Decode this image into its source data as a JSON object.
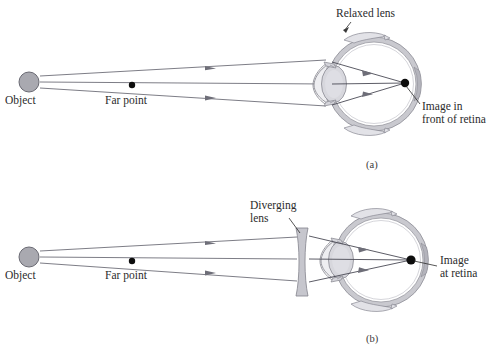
{
  "figure": {
    "background_color": "#ffffff",
    "width": 494,
    "height": 351
  },
  "panels": [
    {
      "tag": "(a)",
      "tag_position": {
        "x": 368,
        "y": 166
      },
      "labels": {
        "object": "Object",
        "far_point": "Far point",
        "lens_state": "Relaxed lens",
        "image_line1": "Image in",
        "image_line2": "front of retina"
      },
      "object_point": {
        "x": 29,
        "y": 82
      },
      "far_point": {
        "x": 132,
        "y": 86
      },
      "image_point": {
        "x": 405,
        "y": 83
      },
      "eye_center": {
        "x": 374,
        "y": 84
      },
      "eye_radius": 48,
      "rays": [
        {
          "name": "upper-ray",
          "from": {
            "x": 40,
            "y": 76
          },
          "to": {
            "x": 325,
            "y": 62
          }
        },
        {
          "name": "axis-ray",
          "from": {
            "x": 40,
            "y": 82
          },
          "to": {
            "x": 325,
            "y": 84
          }
        },
        {
          "name": "lower-ray",
          "from": {
            "x": 40,
            "y": 88
          },
          "to": {
            "x": 325,
            "y": 104
          }
        }
      ]
    },
    {
      "tag": "(b)",
      "tag_position": {
        "x": 368,
        "y": 340
      },
      "labels": {
        "object": "Object",
        "far_point": "Far point",
        "lens_line1": "Diverging",
        "lens_line2": "lens",
        "image_line1": "Image",
        "image_line2": "at retina"
      },
      "object_point": {
        "x": 29,
        "y": 257
      },
      "far_point": {
        "x": 132,
        "y": 262
      },
      "image_point": {
        "x": 411,
        "y": 260
      },
      "eye_center": {
        "x": 381,
        "y": 260
      },
      "eye_radius": 48,
      "diverging_lens": {
        "x": 301,
        "y": 262,
        "height": 68,
        "thickness": 11
      },
      "rays": [
        {
          "name": "upper-ray",
          "from": {
            "x": 40,
            "y": 251
          },
          "to": {
            "x": 296,
            "y": 238
          }
        },
        {
          "name": "axis-ray",
          "from": {
            "x": 40,
            "y": 257
          },
          "to": {
            "x": 296,
            "y": 260
          }
        },
        {
          "name": "lower-ray",
          "from": {
            "x": 40,
            "y": 263
          },
          "to": {
            "x": 296,
            "y": 280
          }
        }
      ]
    }
  ],
  "colors": {
    "ray": "#6e6e78",
    "object_fill": "#a9a9b0",
    "lens_fill": "#d7d7dd",
    "sclera_band": "#c9c9cf",
    "diverging_lens_fill": "#c4c4cb",
    "dot": "#0d0d0d",
    "text": "#2b2b2b"
  }
}
